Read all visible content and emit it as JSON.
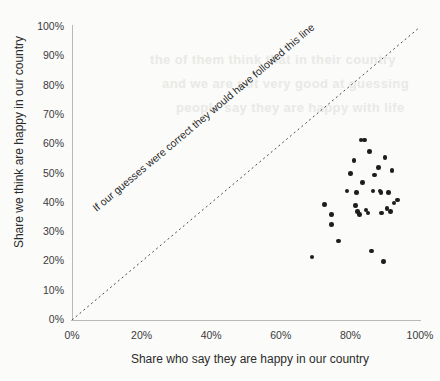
{
  "chart_data": {
    "type": "scatter",
    "title": "",
    "xlabel": "Share who say they are happy in our country",
    "ylabel": "Share we think are happy in our country",
    "xlim": [
      0,
      100
    ],
    "ylim": [
      0,
      100
    ],
    "xticks": [
      "0%",
      "20%",
      "40%",
      "60%",
      "80%",
      "100%"
    ],
    "xtick_values": [
      0,
      20,
      40,
      60,
      80,
      100
    ],
    "yticks": [
      "0%",
      "10%",
      "20%",
      "30%",
      "40%",
      "50%",
      "60%",
      "70%",
      "80%",
      "90%",
      "100%"
    ],
    "ytick_values": [
      0,
      10,
      20,
      30,
      40,
      50,
      60,
      70,
      80,
      90,
      100
    ],
    "grid": false,
    "legend": null,
    "annotations": [
      {
        "text": "If our guesses were correct they would have followed this line",
        "kind": "reference-line-label",
        "rotation_deg": -40
      }
    ],
    "reference_line": {
      "kind": "identity",
      "from": [
        0,
        0
      ],
      "to": [
        100,
        100
      ],
      "style": "dotted",
      "color": "#4a4a4a"
    },
    "marker": {
      "shape": "circle",
      "color": "#1d1d1d",
      "size_px": 4.6
    },
    "series": [
      {
        "name": "Countries",
        "points": [
          [
            69.0,
            21.5
          ],
          [
            72.5,
            39.5
          ],
          [
            74.5,
            36.0
          ],
          [
            74.5,
            32.5
          ],
          [
            76.5,
            27.0
          ],
          [
            79.0,
            44.0
          ],
          [
            80.0,
            50.0
          ],
          [
            81.0,
            54.5
          ],
          [
            81.5,
            39.0
          ],
          [
            81.8,
            43.5
          ],
          [
            82.0,
            37.0
          ],
          [
            82.6,
            36.0
          ],
          [
            83.0,
            61.5
          ],
          [
            83.5,
            47.0
          ],
          [
            84.0,
            61.5
          ],
          [
            84.5,
            37.5
          ],
          [
            85.0,
            36.5
          ],
          [
            85.5,
            57.5
          ],
          [
            86.0,
            23.5
          ],
          [
            86.5,
            44.0
          ],
          [
            87.0,
            49.5
          ],
          [
            88.0,
            52.0
          ],
          [
            88.5,
            44.0
          ],
          [
            88.8,
            43.5
          ],
          [
            89.0,
            36.5
          ],
          [
            89.5,
            20.0
          ],
          [
            90.0,
            55.5
          ],
          [
            90.5,
            38.0
          ],
          [
            91.0,
            43.5
          ],
          [
            91.5,
            37.0
          ],
          [
            92.0,
            51.0
          ],
          [
            92.5,
            40.0
          ],
          [
            93.5,
            41.0
          ]
        ]
      }
    ]
  },
  "bleed_through": {
    "lines": [
      "the of them think that in their country",
      "and we are not very good at guessing",
      "people say they are happy with life"
    ]
  }
}
